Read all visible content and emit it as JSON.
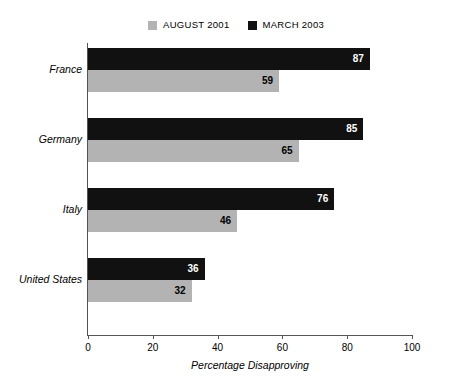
{
  "legend": {
    "entries": [
      {
        "label": "AUGUST 2001",
        "color": "#b3b3b3",
        "swatch_name": "legend-swatch-august-2001"
      },
      {
        "label": "MARCH 2003",
        "color": "#111111",
        "swatch_name": "legend-swatch-march-2003"
      }
    ]
  },
  "axis": {
    "x_title": "Percentage Disapproving",
    "ticks": [
      "0",
      "20",
      "40",
      "60",
      "80",
      "100"
    ]
  },
  "chart_data": {
    "type": "bar",
    "orientation": "horizontal",
    "title": "",
    "subtitle": "",
    "xlabel": "Percentage Disapproving",
    "ylabel": "",
    "xlim": [
      0,
      100
    ],
    "xticks": [
      0,
      20,
      40,
      60,
      80,
      100
    ],
    "grid": false,
    "legend_position": "top",
    "categories": [
      "France",
      "Germany",
      "Italy",
      "United States"
    ],
    "series": [
      {
        "name": "AUGUST 2001",
        "color": "#b3b3b3",
        "values": [
          59,
          65,
          46,
          32
        ]
      },
      {
        "name": "MARCH 2003",
        "color": "#111111",
        "values": [
          87,
          85,
          76,
          36
        ]
      }
    ],
    "data_labels": true
  },
  "groups": [
    {
      "category": "France",
      "recent": {
        "value": 87,
        "label": "87"
      },
      "older": {
        "value": 59,
        "label": "59"
      }
    },
    {
      "category": "Germany",
      "recent": {
        "value": 85,
        "label": "85"
      },
      "older": {
        "value": 65,
        "label": "65"
      }
    },
    {
      "category": "Italy",
      "recent": {
        "value": 76,
        "label": "76"
      },
      "older": {
        "value": 46,
        "label": "46"
      }
    },
    {
      "category": "United States",
      "recent": {
        "value": 36,
        "label": "36"
      },
      "older": {
        "value": 32,
        "label": "32"
      }
    }
  ]
}
